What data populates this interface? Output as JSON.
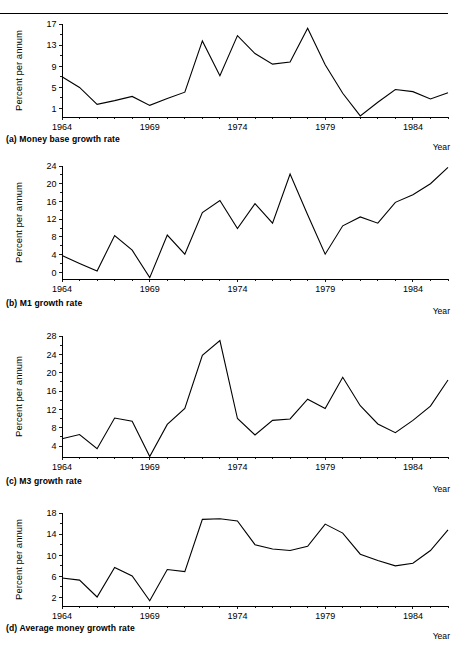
{
  "page": {
    "background_color": "#ffffff",
    "line_color": "#000000",
    "year_axis_label": "Year",
    "y_axis_label": "Percent per annum"
  },
  "chart_data": [
    {
      "type": "line",
      "panel": "a",
      "title": "(a) Money base growth rate",
      "xlabel": "Year",
      "ylabel": "Percent per annum",
      "grid": false,
      "legend": "none",
      "xlim": [
        1964,
        1986
      ],
      "ylim": [
        -0.6,
        17
      ],
      "yticks": [
        1,
        5,
        9,
        13,
        17
      ],
      "xticks": [
        1964,
        1969,
        1974,
        1979,
        1984
      ],
      "xtick_labels": [
        "1964",
        "1969",
        "1974",
        "1979",
        "1984"
      ],
      "x": [
        1964,
        1965,
        1966,
        1967,
        1968,
        1969,
        1970,
        1971,
        1972,
        1973,
        1974,
        1975,
        1976,
        1977,
        1978,
        1979,
        1980,
        1981,
        1982,
        1983,
        1984,
        1985,
        1986
      ],
      "values": [
        7.0,
        5.0,
        1.8,
        2.5,
        3.3,
        1.6,
        2.9,
        4.1,
        13.8,
        7.2,
        14.8,
        11.4,
        9.4,
        9.8,
        16.2,
        9.3,
        3.9,
        -0.4,
        2.2,
        4.6,
        4.2,
        2.8,
        4.0
      ]
    },
    {
      "type": "line",
      "panel": "b",
      "title": "(b) M1 growth rate",
      "xlabel": "Year",
      "ylabel": "Percent per annum",
      "grid": false,
      "legend": "none",
      "xlim": [
        1964,
        1986
      ],
      "ylim": [
        -1.5,
        24
      ],
      "yticks": [
        0,
        4,
        8,
        12,
        16,
        20,
        24
      ],
      "xticks": [
        1964,
        1969,
        1974,
        1979,
        1984
      ],
      "xtick_labels": [
        "1964",
        "1969",
        "1974",
        "1979",
        "1984"
      ],
      "x": [
        1964,
        1965,
        1966,
        1967,
        1968,
        1969,
        1970,
        1971,
        1972,
        1973,
        1974,
        1975,
        1976,
        1977,
        1978,
        1979,
        1980,
        1981,
        1982,
        1983,
        1984,
        1985,
        1986
      ],
      "values": [
        3.8,
        2.0,
        0.3,
        8.3,
        5.0,
        -1.2,
        8.4,
        4.1,
        13.5,
        16.2,
        9.9,
        15.5,
        11.1,
        22.2,
        13.0,
        4.1,
        10.5,
        12.5,
        11.1,
        15.8,
        17.5,
        20.0,
        23.7
      ]
    },
    {
      "type": "line",
      "panel": "c",
      "title": "(c) M3 growth rate",
      "xlabel": "Year",
      "ylabel": "Percent per annum",
      "grid": false,
      "legend": "none",
      "xlim": [
        1964,
        1986
      ],
      "ylim": [
        1.6,
        28
      ],
      "yticks": [
        4,
        8,
        12,
        16,
        20,
        24,
        28
      ],
      "xticks": [
        1964,
        1969,
        1974,
        1979,
        1984
      ],
      "xtick_labels": [
        "1964",
        "1969",
        "1974",
        "1979",
        "1984"
      ],
      "x": [
        1964,
        1965,
        1966,
        1967,
        1968,
        1969,
        1970,
        1971,
        1972,
        1973,
        1974,
        1975,
        1976,
        1977,
        1978,
        1979,
        1980,
        1981,
        1982,
        1983,
        1984,
        1985,
        1986
      ],
      "values": [
        5.6,
        6.5,
        3.4,
        10.1,
        9.4,
        1.7,
        8.7,
        12.2,
        23.8,
        27.0,
        10.0,
        6.4,
        9.6,
        9.9,
        14.2,
        12.2,
        19.0,
        12.8,
        8.8,
        6.9,
        9.6,
        12.7,
        18.4
      ]
    },
    {
      "type": "line",
      "panel": "d",
      "title": "(d) Average money growth rate",
      "xlabel": "Year",
      "ylabel": "Percent per annum",
      "grid": false,
      "legend": "none",
      "xlim": [
        1964,
        1986
      ],
      "ylim": [
        0.4,
        18
      ],
      "yticks": [
        2,
        6,
        10,
        14,
        18
      ],
      "xticks": [
        1964,
        1969,
        1974,
        1979,
        1984
      ],
      "xtick_labels": [
        "1964",
        "1969",
        "1974",
        "1979",
        "1984"
      ],
      "x": [
        1964,
        1965,
        1966,
        1967,
        1968,
        1969,
        1970,
        1971,
        1972,
        1973,
        1974,
        1975,
        1976,
        1977,
        1978,
        1979,
        1980,
        1981,
        1982,
        1983,
        1984,
        1985,
        1986
      ],
      "values": [
        5.7,
        5.3,
        2.1,
        7.7,
        6.1,
        1.4,
        7.3,
        6.9,
        16.8,
        16.9,
        16.5,
        12.0,
        11.2,
        10.9,
        11.7,
        15.9,
        14.2,
        10.2,
        9.0,
        8.0,
        8.5,
        10.9,
        14.8
      ]
    }
  ]
}
